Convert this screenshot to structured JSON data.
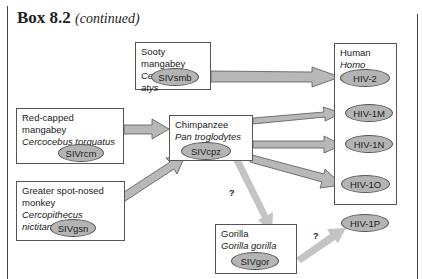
{
  "header": {
    "box_label": "Box 8.2",
    "continued": "(continued)"
  },
  "hosts": [
    {
      "common": "Sooty mangabey",
      "latin": "Cercocebus atys",
      "virus": "SIVsmb"
    },
    {
      "common": "Red-capped mangabey",
      "latin": "Cercocebus torquatus",
      "virus": "SIVrcm"
    },
    {
      "common": "Chimpanzee",
      "latin": "Pan troglodytes",
      "virus": "SIVcpz"
    },
    {
      "common": "Greater spot-nosed",
      "common2": "monkey",
      "latin": "Cercopithecus nictitans",
      "virus": "SIVgsn"
    },
    {
      "common": "Gorilla",
      "latin": "Gorilla gorilla",
      "virus": "SIVgor"
    }
  ],
  "human": {
    "common": "Human",
    "latin": "Homo sapiens",
    "viruses": [
      "HIV-2",
      "HIV-1M",
      "HIV-1N",
      "HIV-1O",
      "HIV-1P"
    ]
  },
  "uncertain_marks": [
    "?",
    "?"
  ],
  "colors": {
    "arrow": "#b8b8b8",
    "arrow_border": "#555555",
    "oval": "#b4b4b4",
    "uncertain_arrow": "#c4c4c4"
  }
}
